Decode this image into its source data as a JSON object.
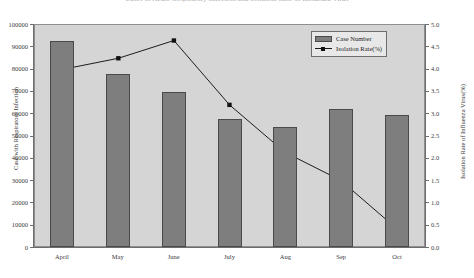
{
  "chart_data": {
    "type": "bar",
    "title": "Cases of Acute Respiratory Infection and Isolation Rate of Influenza Virus",
    "categories": [
      "April",
      "May",
      "June",
      "July",
      "Aug",
      "Sep",
      "Oct"
    ],
    "series": [
      {
        "name": "Case Number",
        "type": "bar",
        "axis": "left",
        "values": [
          93000,
          78000,
          70000,
          57500,
          54000,
          62000,
          59500
        ]
      },
      {
        "name": "Isolation Rate(%)",
        "type": "line",
        "axis": "right",
        "values": [
          4.0,
          4.25,
          4.65,
          3.2,
          2.13,
          1.5,
          0.42
        ]
      }
    ],
    "xlabel": "",
    "ylabel": "Case with Respiratory Infection",
    "y2label": "Isolation Rate of Influenza Virus(%)",
    "ylim": [
      0,
      100000
    ],
    "y2lim": [
      0,
      5.0
    ],
    "yticks": [
      0,
      10000,
      20000,
      30000,
      40000,
      50000,
      60000,
      70000,
      80000,
      90000,
      100000
    ],
    "y2ticks": [
      "0.0",
      "0.5",
      "1.0",
      "1.5",
      "2.0",
      "2.5",
      "3.0",
      "3.5",
      "4.0",
      "4.5",
      "5.0"
    ],
    "grid": false,
    "legend_position": "top-right",
    "colors": {
      "bar_fill": "#7e7e7e",
      "bar_edge": "#4a4a4a",
      "line": "#1a1a1a",
      "marker": "#111111",
      "plot_background": "#d5d5d5",
      "axis": "#6e6e6e"
    }
  },
  "legend": {
    "items": [
      {
        "label": "Case Number"
      },
      {
        "label": "Isolation Rate(%)"
      }
    ]
  }
}
